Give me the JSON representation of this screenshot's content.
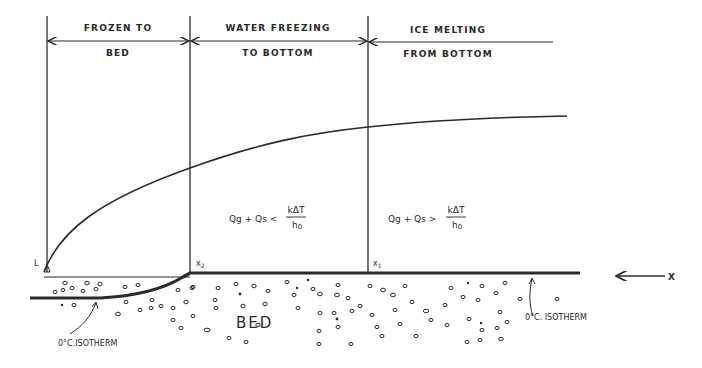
{
  "zones": [
    {
      "line1": "FROZEN TO",
      "line2": "BED"
    },
    {
      "line1": "WATER FREEZING",
      "line2": "TO BOTTOM"
    },
    {
      "line1": "ICE MELTING",
      "line2": "FROM BOTTOM"
    }
  ],
  "points": {
    "L": "L",
    "x2": "x",
    "x2_sub": "2",
    "x1": "x",
    "x1_sub": "1",
    "X": "X"
  },
  "equations": {
    "zone2": {
      "lhs": "Qg + Qs <",
      "num": "kΔT",
      "den": "h",
      "den_sub": "0"
    },
    "zone3": {
      "lhs": "Qg + Qs >",
      "num": "kΔT",
      "den": "h",
      "den_sub": "0"
    }
  },
  "bed_label": "BED",
  "isotherm_left": "0°C.ISOTHERM",
  "isotherm_right": "0°C. ISOTHERM",
  "colors": {
    "ink": "#2a2a2a",
    "background": "#ffffff"
  }
}
